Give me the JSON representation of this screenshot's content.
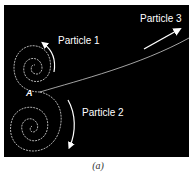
{
  "figure": {
    "caption": "(a)",
    "point_label": "A",
    "particles": [
      {
        "label": "Particle 1"
      },
      {
        "label": "Particle 2"
      },
      {
        "label": "Particle 3"
      }
    ],
    "colors": {
      "background": "#000000",
      "track": "#ffffff"
    }
  }
}
